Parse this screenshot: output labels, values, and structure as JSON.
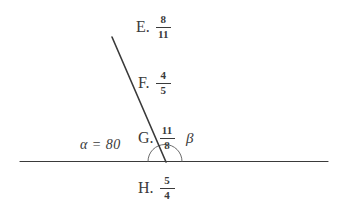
{
  "figure": {
    "background_color": "#ffffff",
    "stroke_color": "#3a3a3a"
  },
  "diagram": {
    "horizontal_line": {
      "name": "baseline",
      "x1": 20,
      "y1": 161,
      "x2": 328,
      "y2": 161
    },
    "slanted_line": {
      "name": "transversal-ray",
      "x1": 112,
      "y1": 37,
      "x2": 166,
      "y2": 162
    },
    "vertex": {
      "x": 165,
      "y": 161
    },
    "arc": {
      "name": "angle-arc",
      "radius": 17,
      "start_angle_deg": 180,
      "end_angle_deg": 0
    }
  },
  "labels": {
    "alpha": "α = 80",
    "beta": "β"
  },
  "choices": [
    {
      "letter": "E.",
      "numerator": "8",
      "denominator": "11"
    },
    {
      "letter": "F.",
      "numerator": "4",
      "denominator": "5"
    },
    {
      "letter": "G.",
      "numerator": "11",
      "denominator": "8"
    },
    {
      "letter": "H.",
      "numerator": "5",
      "denominator": "4"
    }
  ]
}
